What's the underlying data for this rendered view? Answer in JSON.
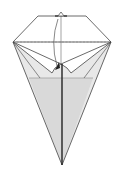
{
  "diagram": {
    "colors": {
      "background": "#ffffff",
      "line": "#444444",
      "shade": "#e6e6e6",
      "shade_dark": "#d4d4d4",
      "center_line": "#333333",
      "dashed": "#888888"
    },
    "elements": {
      "valley_fold_line": "dashed horizontal fold line",
      "fold_arrow": "curved arrow indicating fold down",
      "top_marker": "small triangle reference mark",
      "center_crease": "vertical center crease"
    }
  }
}
